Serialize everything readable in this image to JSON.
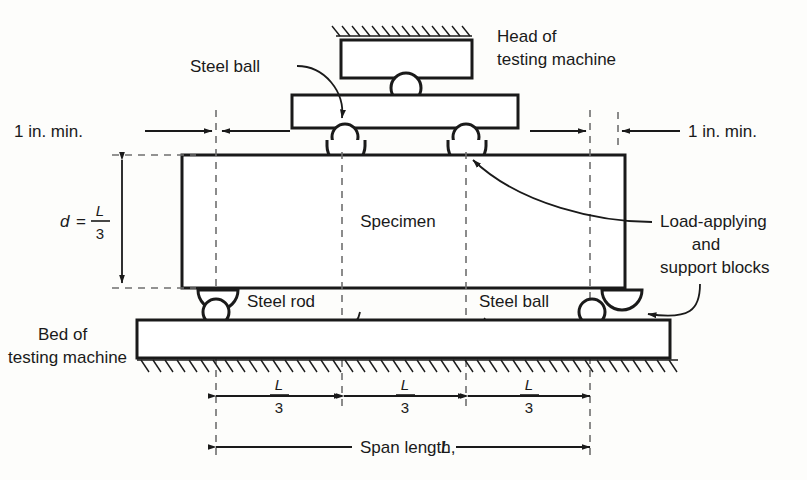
{
  "figure": {
    "type": "technical-diagram"
  },
  "labels": {
    "head_of_machine_line1": "Head of",
    "head_of_machine_line2": "testing machine",
    "steel_ball_top": "Steel ball",
    "steel_ball_bottom": "Steel ball",
    "steel_rod": "Steel rod",
    "specimen": "Specimen",
    "load_blocks_line1": "Load-applying",
    "load_blocks_line2": "and",
    "load_blocks_line3": "support blocks",
    "bed_of_machine_line1": "Bed of",
    "bed_of_machine_line2": "testing machine",
    "one_inch_min_left": "1 in. min.",
    "one_inch_min_right": "1 in. min.",
    "depth_symbol": "d",
    "equals": "=",
    "span_length": "Span length,",
    "span_symbol": "L"
  },
  "dimensions": {
    "depth": {
      "numerator": "L",
      "denominator": "3"
    },
    "third_1": {
      "numerator": "L",
      "denominator": "3"
    },
    "third_2": {
      "numerator": "L",
      "denominator": "3"
    },
    "third_3": {
      "numerator": "L",
      "denominator": "3"
    },
    "span_total_symbol": "L",
    "edge_clearance": "1 in. min."
  },
  "colors": {
    "line": "#1a1a1a",
    "dashed": "#6f6f6f",
    "background": "#fdfdfb",
    "text": "#1a1a1a",
    "hatch": "#1a1a1a"
  },
  "icons": {
    "steel_ball": "circle-icon",
    "support_block": "semicircle-icon",
    "hatching": "hatch-pattern-icon",
    "arrow": "arrow-head-icon"
  }
}
